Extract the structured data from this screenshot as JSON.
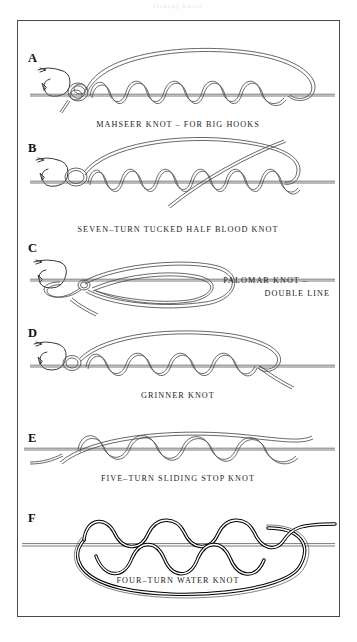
{
  "plate": {
    "top_partial_text": "fishing knots",
    "background_color": "#ffffff",
    "frame_color": "#4a4a4a",
    "ink_color": "#4d4d4d",
    "bold_ink_color": "#000000"
  },
  "figures": [
    {
      "letter": "A",
      "caption": "MAHSEER KNOT – FOR BIG HOOKS",
      "caption_lines": [
        "MAHSEER KNOT – FOR BIG HOOKS"
      ],
      "caption_align": "center",
      "has_hook": true,
      "turns": 6,
      "style": "fine-double-line"
    },
    {
      "letter": "B",
      "caption": "SEVEN–TURN TUCKED HALF BLOOD KNOT",
      "caption_lines": [
        "SEVEN–TURN TUCKED HALF BLOOD KNOT"
      ],
      "caption_align": "center",
      "has_hook": true,
      "turns": 7,
      "style": "fine-double-line"
    },
    {
      "letter": "C",
      "caption": "PALOMAR KNOT – DOUBLE LINE",
      "caption_lines": [
        "PALOMAR KNOT –",
        "DOUBLE LINE"
      ],
      "caption_align": "right",
      "has_hook": true,
      "turns": 0,
      "style": "fine-double-line"
    },
    {
      "letter": "D",
      "caption": "GRINNER KNOT",
      "caption_lines": [
        "GRINNER KNOT"
      ],
      "caption_align": "center",
      "has_hook": true,
      "turns": 5,
      "style": "fine-double-line"
    },
    {
      "letter": "E",
      "caption": "FIVE–TURN SLIDING STOP KNOT",
      "caption_lines": [
        "FIVE–TURN SLIDING STOP KNOT"
      ],
      "caption_align": "center",
      "has_hook": false,
      "turns": 5,
      "style": "fine-double-line"
    },
    {
      "letter": "F",
      "caption": "FOUR–TURN WATER KNOT",
      "caption_lines": [
        "FOUR–TURN WATER KNOT"
      ],
      "caption_align": "center",
      "has_hook": false,
      "turns": 4,
      "style": "bold-rope"
    }
  ]
}
